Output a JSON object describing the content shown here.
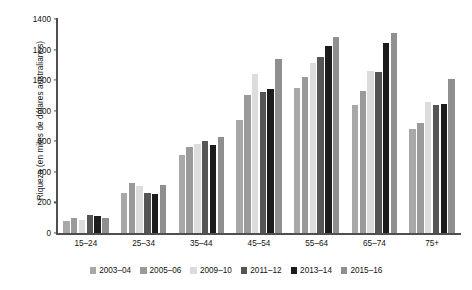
{
  "chart_data": {
    "type": "bar",
    "title": "",
    "subtitle": "",
    "xlabel": "",
    "ylabel": "Riqueza (en miles de dólares australianos)",
    "ylim": [
      0,
      1400
    ],
    "yticks": [
      0,
      200,
      400,
      600,
      800,
      1000,
      1200,
      1400
    ],
    "grid": false,
    "legend_position": "bottom",
    "categories": [
      "15–24",
      "25–34",
      "35–44",
      "45–54",
      "55–64",
      "65–74",
      "75+"
    ],
    "series": [
      {
        "name": "2003–04",
        "color": "#a8a8a8",
        "values": [
          80,
          260,
          510,
          740,
          950,
          840,
          680
        ]
      },
      {
        "name": "2005–06",
        "color": "#9a9a9a",
        "values": [
          95,
          330,
          560,
          900,
          1020,
          930,
          720
        ]
      },
      {
        "name": "2009–10",
        "color": "#dcdcdc",
        "values": [
          85,
          310,
          580,
          1040,
          1110,
          1060,
          860
        ]
      },
      {
        "name": "2011–12",
        "color": "#555555",
        "values": [
          115,
          265,
          600,
          925,
          1150,
          1055,
          835
        ]
      },
      {
        "name": "2013–14",
        "color": "#1c1c1c",
        "values": [
          110,
          255,
          575,
          940,
          1225,
          1240,
          845
        ]
      },
      {
        "name": "2015–16",
        "color": "#8f8f8f",
        "values": [
          100,
          315,
          630,
          1140,
          1280,
          1310,
          1010
        ]
      }
    ]
  }
}
